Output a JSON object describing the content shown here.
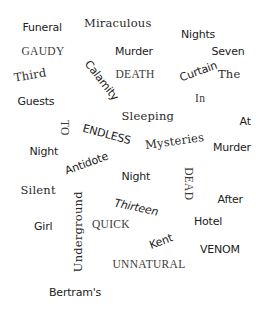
{
  "word_cloud": {
    "background": "#ffffff",
    "text_color": "#222222",
    "words": [
      {
        "text": "Funeral",
        "style": "sans",
        "x": 42,
        "y": 27,
        "rotate": 0
      },
      {
        "text": "Miraculous",
        "style": "slab",
        "x": 118,
        "y": 24,
        "rotate": 0
      },
      {
        "text": "Nights",
        "style": "sans",
        "x": 198,
        "y": 34,
        "rotate": 0
      },
      {
        "text": "GAUDY",
        "style": "serif",
        "x": 43,
        "y": 52,
        "rotate": 0
      },
      {
        "text": "Murder",
        "style": "sans",
        "x": 134,
        "y": 51,
        "rotate": 0
      },
      {
        "text": "Seven",
        "style": "sans",
        "x": 228,
        "y": 51,
        "rotate": 0
      },
      {
        "text": "Third",
        "style": "slab",
        "x": 30,
        "y": 76,
        "rotate": -10
      },
      {
        "text": "Calamity",
        "style": "sans",
        "x": 101,
        "y": 80,
        "rotate": 52
      },
      {
        "text": "DEATH",
        "style": "serif",
        "x": 135,
        "y": 75,
        "rotate": 0
      },
      {
        "text": "Curtain",
        "style": "sans",
        "x": 198,
        "y": 71,
        "rotate": -20
      },
      {
        "text": "The",
        "style": "slab",
        "x": 229,
        "y": 75,
        "rotate": 0
      },
      {
        "text": "Guests",
        "style": "sans",
        "x": 36,
        "y": 101,
        "rotate": 0
      },
      {
        "text": "In",
        "style": "serif",
        "x": 200,
        "y": 99,
        "rotate": 0
      },
      {
        "text": "Sleeping",
        "style": "slab",
        "x": 148,
        "y": 117,
        "rotate": 0
      },
      {
        "text": "At",
        "style": "sans",
        "x": 245,
        "y": 121,
        "rotate": 0
      },
      {
        "text": "TO",
        "style": "serif",
        "x": 64,
        "y": 128,
        "rotate": 90
      },
      {
        "text": "ENDLESS",
        "style": "sans",
        "x": 106,
        "y": 134,
        "rotate": 15
      },
      {
        "text": "Mysteries",
        "style": "slab",
        "x": 174,
        "y": 142,
        "rotate": -8
      },
      {
        "text": "Murder",
        "style": "sans",
        "x": 232,
        "y": 147,
        "rotate": 0
      },
      {
        "text": "Night",
        "style": "sans",
        "x": 44,
        "y": 151,
        "rotate": 0
      },
      {
        "text": "Antidote",
        "style": "sans",
        "x": 86,
        "y": 163,
        "rotate": -20
      },
      {
        "text": "Night",
        "style": "sans",
        "x": 136,
        "y": 176,
        "rotate": 0
      },
      {
        "text": "DEAD",
        "style": "serif",
        "x": 188,
        "y": 184,
        "rotate": 90
      },
      {
        "text": "Silent",
        "style": "slab",
        "x": 38,
        "y": 191,
        "rotate": 0
      },
      {
        "text": "After",
        "style": "sans",
        "x": 230,
        "y": 199,
        "rotate": 0
      },
      {
        "text": "Thirteen",
        "style": "sans italic",
        "x": 136,
        "y": 207,
        "rotate": 12
      },
      {
        "text": "Underground",
        "style": "slab",
        "x": 78,
        "y": 232,
        "rotate": -90
      },
      {
        "text": "Hotel",
        "style": "sans",
        "x": 208,
        "y": 221,
        "rotate": 0
      },
      {
        "text": "Girl",
        "style": "sans",
        "x": 43,
        "y": 226,
        "rotate": 0
      },
      {
        "text": "QUICK",
        "style": "serif",
        "x": 111,
        "y": 225,
        "rotate": 0
      },
      {
        "text": "Kent",
        "style": "sans",
        "x": 161,
        "y": 241,
        "rotate": -20
      },
      {
        "text": "VENOM",
        "style": "sans",
        "x": 220,
        "y": 249,
        "rotate": 0
      },
      {
        "text": "UNNATURAL",
        "style": "serif",
        "x": 149,
        "y": 265,
        "rotate": 0
      },
      {
        "text": "Bertram's",
        "style": "sans",
        "x": 75,
        "y": 292,
        "rotate": 0
      }
    ]
  }
}
